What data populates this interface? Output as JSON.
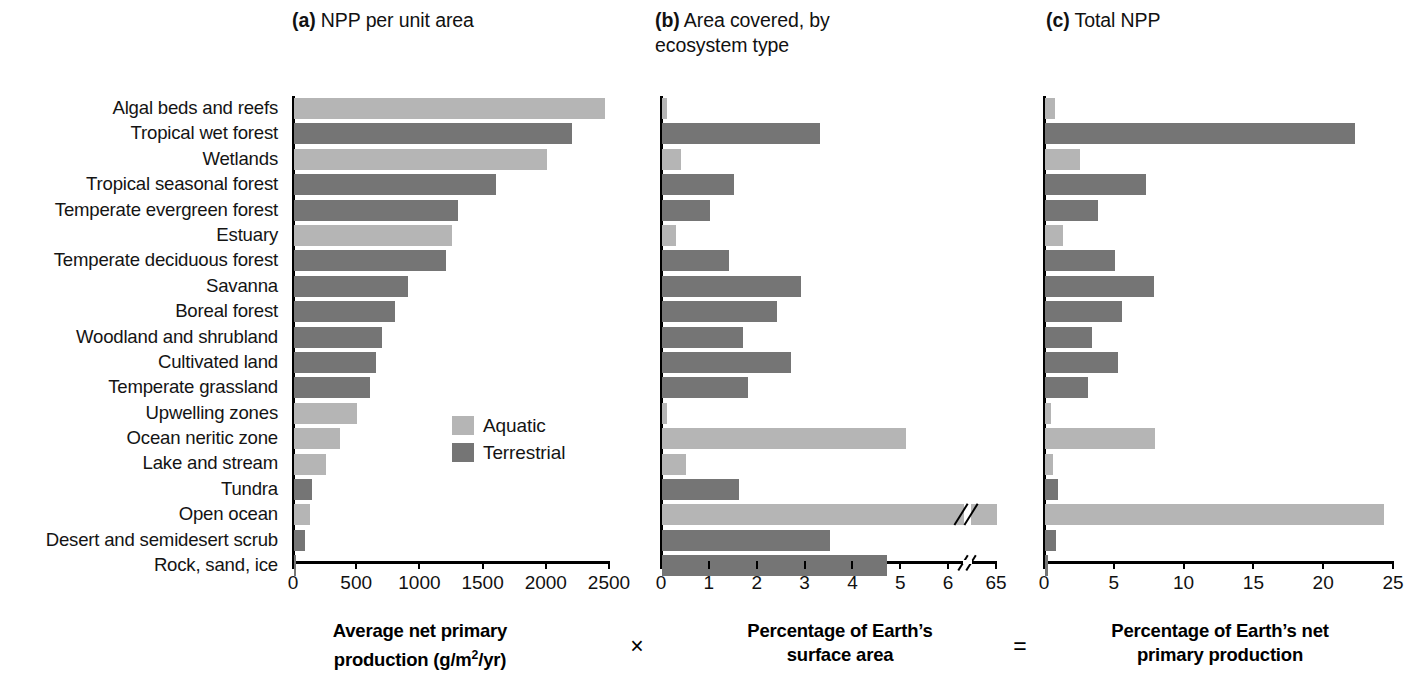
{
  "panels": {
    "a": {
      "tag": "(a)",
      "title": " NPP per unit area"
    },
    "b": {
      "tag": "(b)",
      "title": " Area covered, by\necosystem type"
    },
    "c": {
      "tag": "(c)",
      "title": " Total NPP"
    }
  },
  "legend": {
    "items": [
      {
        "label": "Aquatic",
        "color": "#b5b5b5",
        "key": "aquatic"
      },
      {
        "label": "Terrestrial",
        "color": "#757575",
        "key": "terrestrial"
      }
    ]
  },
  "captions": {
    "a_line1": "Average net primary",
    "a_line2_pre": "production (g/m",
    "a_line2_sup": "2",
    "a_line2_post": "/yr)",
    "b_line1": "Percentage of Earth’s",
    "b_line2": "surface area",
    "c_line1": "Percentage of Earth’s net",
    "c_line2": "primary production",
    "operator_times": "×",
    "operator_equals": "="
  },
  "categories": [
    "Algal beds and reefs",
    "Tropical wet forest",
    "Wetlands",
    "Tropical seasonal forest",
    "Temperate evergreen forest",
    "Estuary",
    "Temperate deciduous forest",
    "Savanna",
    "Boreal forest",
    "Woodland and shrubland",
    "Cultivated land",
    "Temperate grassland",
    "Upwelling zones",
    "Ocean neritic zone",
    "Lake and stream",
    "Tundra",
    "Open ocean",
    "Desert and semidesert scrub",
    "Rock, sand, ice"
  ],
  "chart_data": [
    {
      "type": "bar",
      "orientation": "horizontal",
      "panel": "a",
      "title": "(a) NPP per unit area",
      "xlabel": "Average net primary production (g/m2/yr)",
      "ylabel": "",
      "xlim": [
        0,
        2500
      ],
      "xticks": [
        0,
        500,
        1000,
        1500,
        2000,
        2500
      ],
      "xticklabels": [
        "0",
        "500",
        "1000",
        "1500",
        "2000",
        "2500"
      ],
      "grid": false,
      "legend_position": "inside-right",
      "categories": [
        "Algal beds and reefs",
        "Tropical wet forest",
        "Wetlands",
        "Tropical seasonal forest",
        "Temperate evergreen forest",
        "Estuary",
        "Temperate deciduous forest",
        "Savanna",
        "Boreal forest",
        "Woodland and shrubland",
        "Cultivated land",
        "Temperate grassland",
        "Upwelling zones",
        "Ocean neritic zone",
        "Lake and stream",
        "Tundra",
        "Open ocean",
        "Desert and semidesert scrub",
        "Rock, sand, ice"
      ],
      "values": [
        2460,
        2200,
        2000,
        1600,
        1300,
        1250,
        1200,
        900,
        800,
        700,
        650,
        600,
        500,
        360,
        250,
        140,
        125,
        90,
        3
      ],
      "groups": [
        "aquatic",
        "terrestrial",
        "aquatic",
        "terrestrial",
        "terrestrial",
        "aquatic",
        "terrestrial",
        "terrestrial",
        "terrestrial",
        "terrestrial",
        "terrestrial",
        "terrestrial",
        "aquatic",
        "aquatic",
        "aquatic",
        "terrestrial",
        "aquatic",
        "terrestrial",
        "terrestrial"
      ]
    },
    {
      "type": "bar",
      "orientation": "horizontal",
      "panel": "b",
      "title": "(b) Area covered, by ecosystem type",
      "xlabel": "Percentage of Earth’s surface area",
      "ylabel": "",
      "xlim": [
        0,
        7
      ],
      "axis_break": {
        "after": 6.3,
        "label_at_end": "65",
        "actual_end_value": 65
      },
      "xticks": [
        0,
        1,
        2,
        3,
        4,
        5,
        6,
        7
      ],
      "xticklabels": [
        "0",
        "1",
        "2",
        "3",
        "4",
        "5",
        "6",
        "65"
      ],
      "grid": false,
      "categories": [
        "Algal beds and reefs",
        "Tropical wet forest",
        "Wetlands",
        "Tropical seasonal forest",
        "Temperate evergreen forest",
        "Estuary",
        "Temperate deciduous forest",
        "Savanna",
        "Boreal forest",
        "Woodland and shrubland",
        "Cultivated land",
        "Temperate grassland",
        "Upwelling zones",
        "Ocean neritic zone",
        "Lake and stream",
        "Tundra",
        "Open ocean",
        "Desert and semidesert scrub",
        "Rock, sand, ice"
      ],
      "values": [
        0.1,
        3.3,
        0.4,
        1.5,
        1.0,
        0.3,
        1.4,
        2.9,
        2.4,
        1.7,
        2.7,
        1.8,
        0.1,
        5.1,
        0.5,
        1.6,
        65.0,
        3.5,
        4.7
      ],
      "groups": [
        "aquatic",
        "terrestrial",
        "aquatic",
        "terrestrial",
        "terrestrial",
        "aquatic",
        "terrestrial",
        "terrestrial",
        "terrestrial",
        "terrestrial",
        "terrestrial",
        "terrestrial",
        "aquatic",
        "aquatic",
        "aquatic",
        "terrestrial",
        "aquatic",
        "terrestrial",
        "terrestrial"
      ]
    },
    {
      "type": "bar",
      "orientation": "horizontal",
      "panel": "c",
      "title": "(c) Total NPP",
      "xlabel": "Percentage of Earth’s net primary production",
      "ylabel": "",
      "xlim": [
        0,
        25
      ],
      "xticks": [
        0,
        5,
        10,
        15,
        20,
        25
      ],
      "xticklabels": [
        "0",
        "5",
        "10",
        "15",
        "20",
        "25"
      ],
      "grid": false,
      "categories": [
        "Algal beds and reefs",
        "Tropical wet forest",
        "Wetlands",
        "Tropical seasonal forest",
        "Temperate evergreen forest",
        "Estuary",
        "Temperate deciduous forest",
        "Savanna",
        "Boreal forest",
        "Woodland and shrubland",
        "Cultivated land",
        "Temperate grassland",
        "Upwelling zones",
        "Ocean neritic zone",
        "Lake and stream",
        "Tundra",
        "Open ocean",
        "Desert and semidesert scrub",
        "Rock, sand, ice"
      ],
      "values": [
        0.7,
        22.2,
        2.5,
        7.2,
        3.8,
        1.3,
        5.0,
        7.8,
        5.5,
        3.4,
        5.2,
        3.1,
        0.4,
        7.9,
        0.6,
        0.9,
        24.3,
        0.8,
        0.2
      ],
      "groups": [
        "aquatic",
        "terrestrial",
        "aquatic",
        "terrestrial",
        "terrestrial",
        "aquatic",
        "terrestrial",
        "terrestrial",
        "terrestrial",
        "terrestrial",
        "terrestrial",
        "terrestrial",
        "aquatic",
        "aquatic",
        "aquatic",
        "terrestrial",
        "aquatic",
        "terrestrial",
        "terrestrial"
      ]
    }
  ]
}
